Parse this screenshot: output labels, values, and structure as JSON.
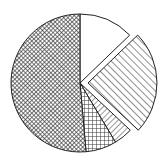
{
  "chart_data": {
    "type": "pie",
    "title": "",
    "legend": null,
    "start_angle_deg": 0,
    "direction": "clockwise",
    "center": [
      80,
      83
    ],
    "radius": 69,
    "slices": [
      {
        "name": "slice-1",
        "label": "",
        "value": 12.8,
        "pattern": "blank",
        "exploded": false
      },
      {
        "name": "slice-2",
        "label": "",
        "value": 24.2,
        "pattern": "diagonal-stripes",
        "exploded": true,
        "explode_offset": 8
      },
      {
        "name": "slice-3",
        "label": "",
        "value": 4.4,
        "pattern": "radial-stripes",
        "exploded": false
      },
      {
        "name": "slice-4",
        "label": "",
        "value": 7.2,
        "pattern": "grid",
        "exploded": false
      },
      {
        "name": "slice-5",
        "label": "",
        "value": 51.4,
        "pattern": "dense-crosshatch",
        "exploded": false
      }
    ],
    "categories": [
      "slice-1",
      "slice-2",
      "slice-3",
      "slice-4",
      "slice-5"
    ],
    "values": [
      12.8,
      24.2,
      4.4,
      7.2,
      51.4
    ],
    "colors": {
      "stroke": "#222222",
      "fill_background": "#ffffff",
      "pattern_ink": "#333333"
    }
  }
}
